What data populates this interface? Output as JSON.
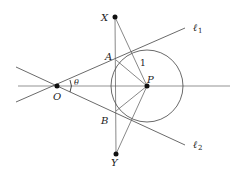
{
  "diagram": {
    "points": {
      "O": {
        "label": "O",
        "x": 57,
        "y": 86
      },
      "P": {
        "label": "P",
        "x": 147,
        "y": 86
      },
      "X": {
        "label": "X",
        "x": 115,
        "y": 17
      },
      "Y": {
        "label": "Y",
        "x": 116,
        "y": 154
      },
      "A": {
        "label": "A",
        "x": 116,
        "y": 60
      },
      "B": {
        "label": "B",
        "x": 116,
        "y": 111
      }
    },
    "lines": {
      "l1": {
        "label": "ℓ",
        "subscript": "1"
      },
      "l2": {
        "label": "ℓ",
        "subscript": "2"
      }
    },
    "angle_label": "θ",
    "radius_label": "1",
    "circle": {
      "cx": 147,
      "cy": 86,
      "r": 36
    }
  }
}
